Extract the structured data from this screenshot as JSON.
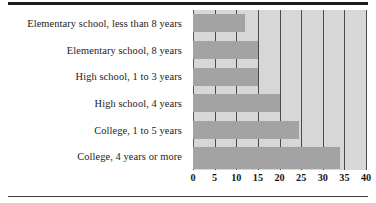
{
  "chart_data": {
    "type": "bar",
    "orientation": "horizontal",
    "title": "",
    "subtitle": "",
    "xlabel": "",
    "ylabel": "",
    "categories": [
      "Elementary school, less than 8 years",
      "Elementary school, 8 years",
      "High school, 1 to 3 years",
      "High school, 4 years",
      "College, 1 to 5 years",
      "College, 4 years or more"
    ],
    "values": [
      12,
      15,
      15,
      20,
      24.5,
      34
    ],
    "xlim": [
      0,
      40
    ],
    "xticks": [
      0,
      5,
      10,
      15,
      20,
      25,
      30,
      35,
      40
    ],
    "xtick_labels": [
      "0",
      "5",
      "10",
      "15",
      "20",
      "25",
      "30",
      "35",
      "40"
    ],
    "grid": true,
    "grid_axis": "x",
    "legend": false,
    "legend_position": "none",
    "series": [
      {
        "name": "",
        "values": [
          12,
          15,
          15,
          20,
          24.5,
          34
        ]
      }
    ]
  },
  "colors": {
    "plot_background": "#d7d7d7",
    "bar_fill": "#a3a3a3",
    "gridline": "#4a4a4a",
    "text": "#1b1b1b",
    "rule": "#1a1a1a",
    "page_background": "#ffffff"
  }
}
